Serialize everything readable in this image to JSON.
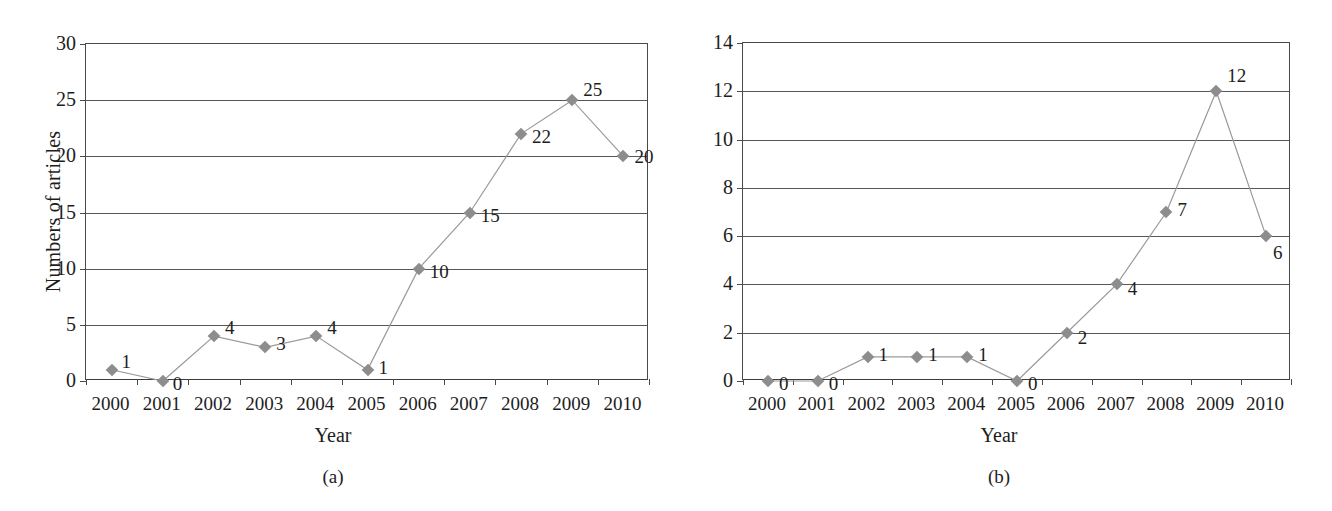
{
  "figure": {
    "background": "#ffffff",
    "marker_color": "#8d8d8d",
    "line_color": "#9a9a9a",
    "axis_color": "#4a4a4a",
    "text_color": "#1d1d1d"
  },
  "panels": [
    {
      "id": "a",
      "caption": "(a)",
      "chart_data": {
        "type": "line",
        "title": "",
        "xlabel": "Year",
        "ylabel": "Numbers of articles",
        "categories": [
          "2000",
          "2001",
          "2002",
          "2003",
          "2004",
          "2005",
          "2006",
          "2007",
          "2008",
          "2009",
          "2010"
        ],
        "values": [
          1,
          0,
          4,
          3,
          4,
          1,
          10,
          15,
          22,
          25,
          20
        ],
        "data_labels": [
          "1",
          "0",
          "4",
          "3",
          "4",
          "1",
          "10",
          "15",
          "22",
          "25",
          "20"
        ],
        "ylim": [
          0,
          30
        ],
        "yticks": [
          0,
          5,
          10,
          15,
          20,
          25,
          30
        ],
        "ytick_labels": [
          "0",
          "5",
          "10",
          "15",
          "20",
          "25",
          "30"
        ],
        "grid": true,
        "legend": "none",
        "marker": "diamond"
      }
    },
    {
      "id": "b",
      "caption": "(b)",
      "chart_data": {
        "type": "line",
        "title": "",
        "xlabel": "Year",
        "ylabel": "Numbers of articles",
        "categories": [
          "2000",
          "2001",
          "2002",
          "2003",
          "2004",
          "2005",
          "2006",
          "2007",
          "2008",
          "2009",
          "2010"
        ],
        "values": [
          0,
          0,
          1,
          1,
          1,
          0,
          2,
          4,
          7,
          12,
          6
        ],
        "data_labels": [
          "0",
          "0",
          "1",
          "1",
          "1",
          "0",
          "2",
          "4",
          "7",
          "12",
          "6"
        ],
        "ylim": [
          0,
          14
        ],
        "yticks": [
          0,
          2,
          4,
          6,
          8,
          10,
          12,
          14
        ],
        "ytick_labels": [
          "0",
          "2",
          "4",
          "6",
          "8",
          "10",
          "12",
          "14"
        ],
        "grid": true,
        "legend": "none",
        "marker": "diamond"
      }
    }
  ]
}
